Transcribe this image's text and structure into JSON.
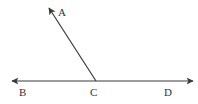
{
  "diagram": {
    "type": "geometry-angle",
    "colors": {
      "stroke": "#3a3a3a",
      "label": "#333333",
      "background": "#ffffff"
    },
    "points": {
      "A": {
        "label": "A",
        "x": 49,
        "y": 8,
        "label_x": 58,
        "label_y": 16
      },
      "B": {
        "label": "B",
        "x": 12,
        "y": 81,
        "label_x": 19,
        "label_y": 96
      },
      "C": {
        "label": "C",
        "x": 96,
        "y": 81,
        "label_x": 90,
        "label_y": 96
      },
      "D": {
        "label": "D",
        "x": 193,
        "y": 81,
        "label_x": 164,
        "label_y": 96
      }
    },
    "segments": [
      {
        "from": "C",
        "to": "A",
        "arrow_end": true,
        "name": "ray-CA"
      },
      {
        "from": "B",
        "to": "D",
        "arrow_start": true,
        "arrow_end": true,
        "name": "line-BD"
      }
    ]
  }
}
